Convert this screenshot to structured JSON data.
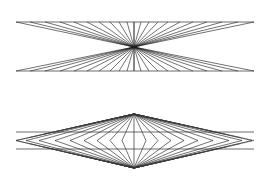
{
  "canvas": {
    "width": 269,
    "height": 181,
    "background_color": "#ffffff",
    "stroke_color": "#1a1a1a",
    "stroke_width": 0.62
  },
  "figures": [
    {
      "id": "figure-top",
      "name": "radiant-starburst-hourglass",
      "description": "Perspective starburst: straight rays radiating from a single central vanishing point out to two horizontal rails, forming an hourglass/bowtie envelope.",
      "center": {
        "x": 134,
        "y": 47
      },
      "bounds": {
        "left": 16,
        "right": 254,
        "top": 22,
        "bottom": 71
      },
      "rails": [
        {
          "name": "top-rail",
          "y": 22,
          "x1": 16,
          "x2": 254
        },
        {
          "name": "bottom-rail",
          "y": 71,
          "x1": 16,
          "x2": 254
        }
      ],
      "vertical_axis": {
        "x": 134,
        "y1": 22,
        "y2": 71
      },
      "ray_count_per_quadrant": 11,
      "ray_endpoints_top": [
        16,
        30,
        45,
        60,
        74,
        87,
        99,
        110,
        119,
        127,
        134,
        141,
        149,
        158,
        168,
        180,
        193,
        207,
        222,
        238,
        254
      ],
      "ray_endpoints_bottom": [
        16,
        30,
        45,
        60,
        74,
        87,
        99,
        110,
        119,
        127,
        134,
        141,
        149,
        158,
        168,
        180,
        193,
        207,
        222,
        238,
        254
      ]
    },
    {
      "id": "figure-bottom",
      "name": "nested-diamond-lattice",
      "description": "Nested concentric diamonds (rhombi) sharing common top and bottom apex vertices, crossed by two horizontal rails and a vertical axis, with rays converging on both apexes.",
      "apex_top": {
        "x": 134,
        "y": 114
      },
      "apex_bottom": {
        "x": 134,
        "y": 168
      },
      "bounds": {
        "left": 16,
        "right": 254,
        "top": 114,
        "bottom": 168
      },
      "rails": [
        {
          "name": "upper-rail",
          "y": 132,
          "x1": 16,
          "x2": 254
        },
        {
          "name": "lower-rail",
          "y": 149,
          "x1": 16,
          "x2": 254
        }
      ],
      "vertical_axis": {
        "x": 134,
        "y1": 114,
        "y2": 168
      },
      "diamond_count": 9,
      "diamond_half_widths": [
        12,
        24,
        37,
        50,
        64,
        79,
        95,
        108,
        118
      ],
      "diamond_mid_y": 140.5,
      "ray_count_per_apex": 9
    }
  ],
  "labels": {
    "figure_top_label": "",
    "figure_bottom_label": "",
    "caption": ""
  }
}
